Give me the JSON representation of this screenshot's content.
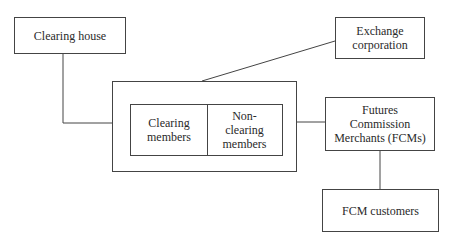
{
  "diagram": {
    "nodes": {
      "clearing_house": "Clearing house",
      "exchange_corporation": "Exchange\ncorporation",
      "clearing_members": "Clearing\nmembers",
      "non_clearing_members": "Non-\nclearing\nmembers",
      "fcms": "Futures\nCommission\nMerchants (FCMs)",
      "fcm_customers": "FCM customers"
    },
    "edges": [
      {
        "from": "clearing_house",
        "to": "members_group"
      },
      {
        "from": "exchange_corporation",
        "to": "members_group"
      },
      {
        "from": "members_group",
        "to": "fcms"
      },
      {
        "from": "fcms",
        "to": "fcm_customers"
      }
    ],
    "colors": {
      "line": "#444444",
      "text": "#2a2a2a",
      "background": "#ffffff"
    }
  }
}
